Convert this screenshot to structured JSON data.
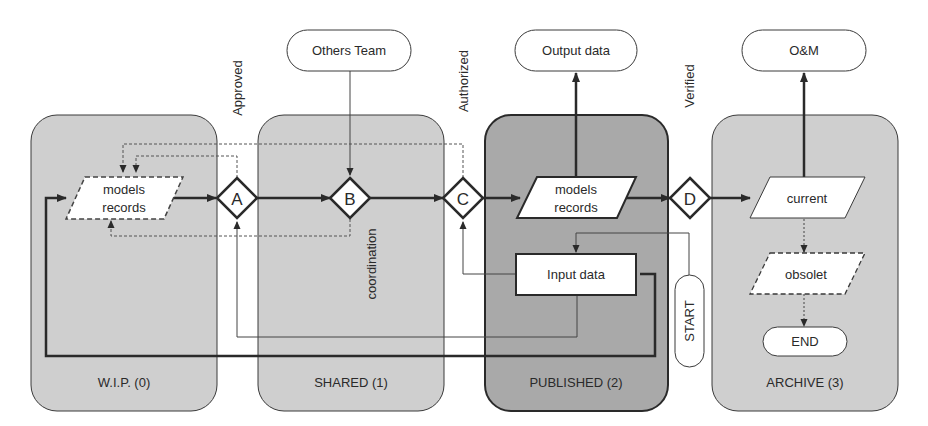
{
  "diagram": {
    "stages": [
      {
        "id": "wip",
        "label": "W.I.P. (0)"
      },
      {
        "id": "shared",
        "label": "SHARED (1)"
      },
      {
        "id": "published",
        "label": "PUBLISHED (2)"
      },
      {
        "id": "archive",
        "label": "ARCHIVE (3)"
      }
    ],
    "gates": [
      {
        "id": "A",
        "label": "A",
        "caption": "Approved"
      },
      {
        "id": "B",
        "label": "B",
        "caption": "coordination"
      },
      {
        "id": "C",
        "label": "C",
        "caption": "Authorized"
      },
      {
        "id": "D",
        "label": "D",
        "caption": "Verified"
      }
    ],
    "terminals": {
      "others_team": "Others Team",
      "output_data": "Output data",
      "om": "O&M",
      "start": "START",
      "end": "END"
    },
    "data_nodes": {
      "wip_models_line1": "models",
      "wip_models_line2": "records",
      "pub_models_line1": "models",
      "pub_models_line2": "records",
      "input_data": "Input data",
      "current": "current",
      "obsolete": "obsolet"
    },
    "colors": {
      "stage_fill": "#cfcfcf",
      "published_fill": "#a9a9a9",
      "stroke": "#2a2a2a",
      "background": "#ffffff"
    }
  }
}
